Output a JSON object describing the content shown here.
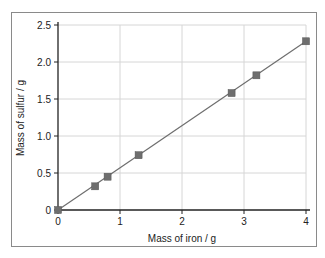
{
  "chart_data": {
    "type": "scatter",
    "title": "",
    "xlabel": "Mass of iron / g",
    "ylabel": "Mass of sulfur / g",
    "xlim": [
      0,
      4
    ],
    "ylim": [
      0,
      2.5
    ],
    "x_ticks": [
      "0",
      "1",
      "2",
      "3",
      "4"
    ],
    "y_ticks": [
      "0",
      "0.5",
      "1.0",
      "1.5",
      "2.0",
      "2.5"
    ],
    "grid": true,
    "legend": null,
    "trendline": "linear through origin",
    "series": [
      {
        "name": "Iron vs sulfur",
        "marker": "square",
        "x": [
          0,
          0.6,
          0.8,
          1.3,
          2.8,
          3.2,
          4.0
        ],
        "y": [
          0,
          0.32,
          0.45,
          0.74,
          1.58,
          1.82,
          2.28
        ]
      }
    ]
  },
  "colors": {
    "marker": "#6e6e6e",
    "line": "#6e6e6e",
    "grid": "#d6d6d6",
    "axis": "#222222",
    "frame": "#8a8a8a"
  }
}
